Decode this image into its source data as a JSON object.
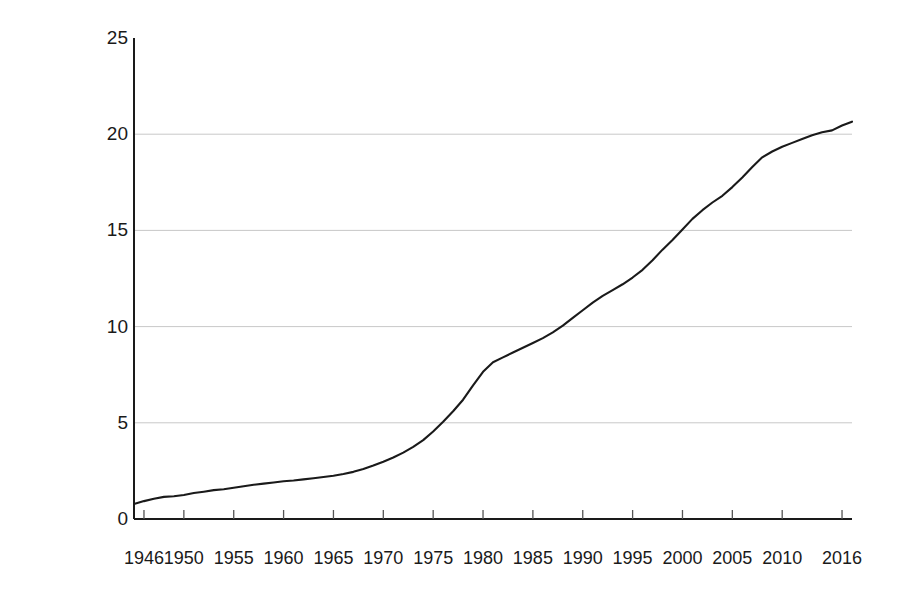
{
  "figure": {
    "background_color": "#ffffff",
    "line_color": "#1a1a1a",
    "grid_color": "#c8c8c8",
    "axis_color": "#1a1a1a"
  },
  "chart_data": {
    "type": "line",
    "title": "",
    "xlabel": "",
    "ylabel": "Nominal Wages (in dollars)",
    "ylim": [
      0,
      25
    ],
    "yticks": [
      0,
      5,
      10,
      15,
      20,
      25
    ],
    "ytick_labels": [
      "0",
      "5",
      "10",
      "15",
      "20",
      "25"
    ],
    "gridlines_y": [
      5,
      10,
      15,
      20
    ],
    "grid": "horizontal-only",
    "legend": "none",
    "xlim": [
      1945,
      2017
    ],
    "xtick_labels": [
      "1946",
      "1950",
      "1955",
      "1960",
      "1965",
      "1970",
      "1975",
      "1980",
      "1985",
      "1990",
      "1995",
      "2000",
      "2005",
      "2010",
      "2016"
    ],
    "xticks": [
      1946,
      1950,
      1955,
      1960,
      1965,
      1970,
      1975,
      1980,
      1985,
      1990,
      1995,
      2000,
      2005,
      2010,
      2016
    ],
    "series": [
      {
        "name": "Nominal Wages",
        "x": [
          1945,
          1946,
          1947,
          1948,
          1949,
          1950,
          1951,
          1952,
          1953,
          1954,
          1955,
          1956,
          1957,
          1958,
          1959,
          1960,
          1961,
          1962,
          1963,
          1964,
          1965,
          1966,
          1967,
          1968,
          1969,
          1970,
          1971,
          1972,
          1973,
          1974,
          1975,
          1976,
          1977,
          1978,
          1979,
          1980,
          1981,
          1982,
          1983,
          1984,
          1985,
          1986,
          1987,
          1988,
          1989,
          1990,
          1991,
          1992,
          1993,
          1994,
          1995,
          1996,
          1997,
          1998,
          1999,
          2000,
          2001,
          2002,
          2003,
          2004,
          2005,
          2006,
          2007,
          2008,
          2009,
          2010,
          2011,
          2012,
          2013,
          2014,
          2015,
          2016,
          2017
        ],
        "y": [
          0.78,
          0.93,
          1.05,
          1.15,
          1.18,
          1.25,
          1.35,
          1.42,
          1.5,
          1.55,
          1.62,
          1.7,
          1.78,
          1.84,
          1.9,
          1.96,
          2.0,
          2.06,
          2.12,
          2.18,
          2.25,
          2.34,
          2.45,
          2.6,
          2.78,
          2.98,
          3.2,
          3.45,
          3.75,
          4.1,
          4.55,
          5.05,
          5.6,
          6.2,
          6.95,
          7.65,
          8.15,
          8.4,
          8.65,
          8.9,
          9.15,
          9.4,
          9.7,
          10.05,
          10.45,
          10.85,
          11.25,
          11.6,
          11.9,
          12.2,
          12.55,
          12.95,
          13.45,
          14.0,
          14.5,
          15.05,
          15.6,
          16.05,
          16.45,
          16.8,
          17.25,
          17.75,
          18.3,
          18.8,
          19.1,
          19.35,
          19.55,
          19.75,
          19.95,
          20.1,
          20.2,
          20.45,
          20.65
        ]
      }
    ]
  }
}
